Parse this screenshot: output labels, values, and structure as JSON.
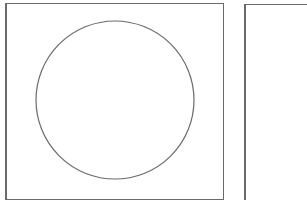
{
  "panels": [
    {
      "id": "left",
      "shape": "circle",
      "circle": {
        "cx": 115,
        "cy": 100,
        "r": 79,
        "stroke": "#6a6a6a"
      }
    },
    {
      "id": "right",
      "shape": "none"
    }
  ],
  "colors": {
    "border": "#6a6a6a",
    "background": "#ffffff"
  }
}
